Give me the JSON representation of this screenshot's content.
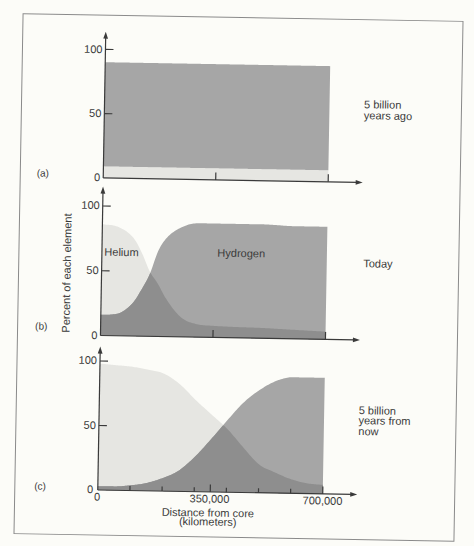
{
  "figure": {
    "y_axis_label": "Percent of each element",
    "x_axis_label": {
      "line1": "Distance from core",
      "line2": "(kilometers)"
    },
    "x_tick_labels": [
      "0",
      "350,000",
      "700,000"
    ],
    "panels": [
      {
        "label": "(a)",
        "caption": [
          "5 billion",
          "years ago"
        ],
        "y_tick_labels": [
          "0",
          "50",
          "100"
        ]
      },
      {
        "label": "(b)",
        "caption": [
          "Today"
        ],
        "y_tick_labels": [
          "0",
          "50",
          "100"
        ],
        "area_labels": {
          "helium": "Helium",
          "hydrogen": "Hydrogen"
        }
      },
      {
        "label": "(c)",
        "caption": [
          "5 billion",
          "years from",
          "now"
        ],
        "y_tick_labels": [
          "0",
          "50",
          "100"
        ]
      }
    ]
  },
  "colors": {
    "background": "#fcfcf8",
    "frame": "#8a8a8a",
    "axis": "#3a3a3a",
    "text": "#3a3a3a",
    "helium": "#e6e6e2",
    "hydrogen": "#a6a6a6",
    "overlap": "#8e8e8e"
  },
  "chart_data": [
    {
      "type": "area",
      "panel": "(a)",
      "title": "5 billion years ago",
      "xlabel": "Distance from core (kilometers)",
      "ylabel": "Percent of each element",
      "xlim": [
        0,
        700000
      ],
      "ylim": [
        0,
        100
      ],
      "yticks": [
        0,
        50,
        100
      ],
      "xticks": [
        350000,
        700000
      ],
      "xticks_minor": [],
      "grid": false,
      "legend": "none",
      "render": "stacked",
      "x": [
        0,
        700000
      ],
      "series": [
        {
          "name": "Helium",
          "values": [
            9,
            9
          ],
          "color": "#e6e6e2"
        },
        {
          "name": "Hydrogen",
          "values": [
            90,
            90
          ],
          "color": "#a6a6a6"
        }
      ]
    },
    {
      "type": "area",
      "panel": "(b)",
      "title": "Today",
      "xlabel": "Distance from core (kilometers)",
      "ylabel": "Percent of each element",
      "xlim": [
        0,
        700000
      ],
      "ylim": [
        0,
        100
      ],
      "yticks": [
        0,
        50,
        100
      ],
      "xticks": [
        350000,
        700000
      ],
      "xticks_minor": [],
      "grid": false,
      "legend": "in-plot labels",
      "annotations": [
        "Helium",
        "Hydrogen"
      ],
      "render": "overlap",
      "overlap_color": "#8e8e8e",
      "x": [
        0,
        50000,
        100000,
        125000,
        150000,
        175000,
        200000,
        250000,
        300000,
        350000,
        400000,
        500000,
        600000,
        700000
      ],
      "series": [
        {
          "name": "Helium",
          "values": [
            86,
            84,
            75,
            64,
            50,
            41,
            30,
            15,
            10,
            9,
            8.5,
            8,
            7,
            6
          ],
          "color": "#e6e6e2"
        },
        {
          "name": "Hydrogen",
          "values": [
            16,
            17,
            26,
            36,
            48,
            66,
            76,
            85,
            88,
            88,
            88,
            88,
            87,
            87
          ],
          "color": "#a6a6a6"
        }
      ]
    },
    {
      "type": "area",
      "panel": "(c)",
      "title": "5 billion years from now",
      "xlabel": "Distance from core (kilometers)",
      "ylabel": "Percent of each element",
      "xlim": [
        0,
        700000
      ],
      "ylim": [
        0,
        100
      ],
      "yticks": [
        0,
        50,
        100
      ],
      "xticks": [
        350000,
        700000
      ],
      "xticks_minor": [
        100000,
        200000,
        300000,
        400000,
        500000,
        600000
      ],
      "xtick_labels": [
        "0",
        "350,000",
        "700,000"
      ],
      "grid": false,
      "legend": "none",
      "render": "overlap",
      "overlap_color": "#8e8e8e",
      "x": [
        0,
        50000,
        100000,
        150000,
        200000,
        250000,
        300000,
        350000,
        400000,
        450000,
        500000,
        550000,
        600000,
        650000,
        700000
      ],
      "series": [
        {
          "name": "Helium",
          "values": [
            98,
            97,
            96,
            94,
            91,
            83,
            71,
            60,
            49,
            35,
            22,
            16,
            11,
            8,
            7
          ],
          "color": "#e6e6e2"
        },
        {
          "name": "Hydrogen",
          "values": [
            3,
            3,
            4,
            6,
            10,
            16,
            27,
            41,
            56,
            70,
            80,
            87,
            90,
            90,
            90
          ],
          "color": "#a6a6a6"
        }
      ]
    }
  ]
}
